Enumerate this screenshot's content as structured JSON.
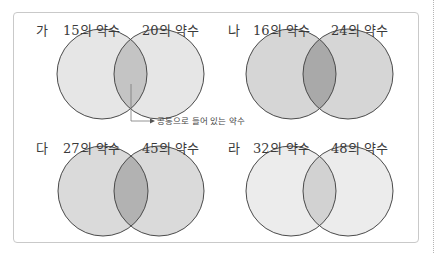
{
  "panels": [
    {
      "tag": "가",
      "left_label": "15의 약수",
      "right_label": "20의 약수",
      "colors": {
        "circle": "#e6e6e6",
        "overlap": "#c4c4c4"
      }
    },
    {
      "tag": "나",
      "left_label": "16의 약수",
      "right_label": "24의 약수",
      "colors": {
        "circle": "#d6d6d6",
        "overlap": "#a9a9a9"
      }
    },
    {
      "tag": "다",
      "left_label": "27의 약수",
      "right_label": "45의 약수",
      "colors": {
        "circle": "#dadada",
        "overlap": "#b2b2b2"
      }
    },
    {
      "tag": "라",
      "left_label": "32의 약수",
      "right_label": "48의 약수",
      "colors": {
        "circle": "#ececec",
        "overlap": "#d2d2d2"
      }
    }
  ],
  "annotation": {
    "text": "공통으로 들어 있는 약수"
  },
  "colors": {
    "stroke": "#4a4a4a",
    "frame": "#c9c9c9"
  }
}
